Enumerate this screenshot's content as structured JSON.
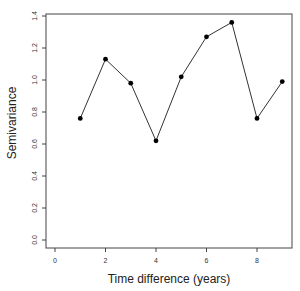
{
  "chart_data": {
    "type": "line",
    "title": "",
    "xlabel": "Time difference (years)",
    "ylabel": "Semivariance",
    "x": [
      1,
      2,
      3,
      4,
      5,
      6,
      7,
      8,
      9
    ],
    "series": [
      {
        "name": "Semivariance",
        "values": [
          0.76,
          1.13,
          0.98,
          0.62,
          1.02,
          1.27,
          1.36,
          0.76,
          0.99
        ]
      }
    ],
    "xlim": [
      -0.35,
      9.4
    ],
    "ylim": [
      -0.05,
      1.42
    ],
    "xticks": [
      0,
      2,
      4,
      6,
      8
    ],
    "xtick_labels": [
      "0",
      "2",
      "4",
      "6",
      "8"
    ],
    "yticks": [
      0.0,
      0.2,
      0.4,
      0.6,
      0.8,
      1.0,
      1.2,
      1.4
    ],
    "ytick_labels": [
      "0.0",
      "0.2",
      "0.4",
      "0.6",
      "0.8",
      "1.0",
      "1.2",
      "1.4"
    ],
    "grid": false,
    "legend": null,
    "marker": "filled-circle",
    "line_color": "#333333",
    "marker_color": "#000000"
  }
}
